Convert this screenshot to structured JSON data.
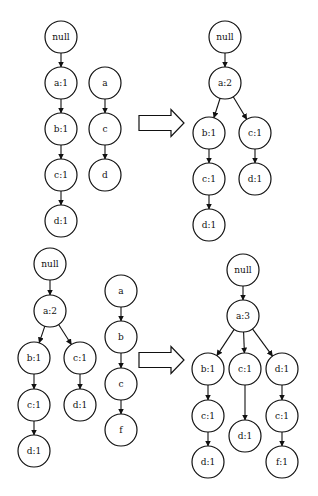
{
  "diagram": {
    "style": {
      "stroke": "#111111",
      "fill": "#ffffff",
      "node_radius": 16
    },
    "panels": [
      {
        "id": "p1-existing",
        "nodes": [
          {
            "id": "n1",
            "label": "null",
            "x": 61,
            "y": 37
          },
          {
            "id": "n2",
            "label": "a:1",
            "x": 61,
            "y": 83
          },
          {
            "id": "n3",
            "label": "b:1",
            "x": 61,
            "y": 129
          },
          {
            "id": "n4",
            "label": "c:1",
            "x": 61,
            "y": 175
          },
          {
            "id": "n5",
            "label": "d:1",
            "x": 61,
            "y": 221
          }
        ],
        "edges": [
          [
            "n1",
            "n2"
          ],
          [
            "n2",
            "n3"
          ],
          [
            "n3",
            "n4"
          ],
          [
            "n4",
            "n5"
          ]
        ]
      },
      {
        "id": "p1-transaction",
        "nodes": [
          {
            "id": "t1",
            "label": "a",
            "x": 105,
            "y": 83
          },
          {
            "id": "t2",
            "label": "c",
            "x": 105,
            "y": 129
          },
          {
            "id": "t3",
            "label": "d",
            "x": 105,
            "y": 175
          }
        ],
        "edges": [
          [
            "t1",
            "t2"
          ],
          [
            "t2",
            "t3"
          ]
        ]
      },
      {
        "id": "p1-result",
        "nodes": [
          {
            "id": "r1",
            "label": "null",
            "x": 225,
            "y": 37
          },
          {
            "id": "r2",
            "label": "a:2",
            "x": 225,
            "y": 83
          },
          {
            "id": "r3",
            "label": "b:1",
            "x": 209,
            "y": 133
          },
          {
            "id": "r4",
            "label": "c:1",
            "x": 255,
            "y": 133
          },
          {
            "id": "r5",
            "label": "c:1",
            "x": 209,
            "y": 179
          },
          {
            "id": "r6",
            "label": "d:1",
            "x": 255,
            "y": 179
          },
          {
            "id": "r7",
            "label": "d:1",
            "x": 209,
            "y": 225
          }
        ],
        "edges": [
          [
            "r1",
            "r2"
          ],
          [
            "r2",
            "r3"
          ],
          [
            "r2",
            "r4"
          ],
          [
            "r3",
            "r5"
          ],
          [
            "r4",
            "r6"
          ],
          [
            "r5",
            "r7"
          ]
        ]
      },
      {
        "id": "p2-existing",
        "nodes": [
          {
            "id": "m1",
            "label": "null",
            "x": 50,
            "y": 264
          },
          {
            "id": "m2",
            "label": "a:2",
            "x": 50,
            "y": 311
          },
          {
            "id": "m3",
            "label": "b:1",
            "x": 34,
            "y": 358
          },
          {
            "id": "m4",
            "label": "c:1",
            "x": 80,
            "y": 358
          },
          {
            "id": "m5",
            "label": "c:1",
            "x": 34,
            "y": 405
          },
          {
            "id": "m6",
            "label": "d:1",
            "x": 80,
            "y": 405
          },
          {
            "id": "m7",
            "label": "d:1",
            "x": 34,
            "y": 451
          }
        ],
        "edges": [
          [
            "m1",
            "m2"
          ],
          [
            "m2",
            "m3"
          ],
          [
            "m2",
            "m4"
          ],
          [
            "m3",
            "m5"
          ],
          [
            "m4",
            "m6"
          ],
          [
            "m5",
            "m7"
          ]
        ]
      },
      {
        "id": "p2-transaction",
        "nodes": [
          {
            "id": "u1",
            "label": "a",
            "x": 121,
            "y": 291
          },
          {
            "id": "u2",
            "label": "b",
            "x": 121,
            "y": 337
          },
          {
            "id": "u3",
            "label": "c",
            "x": 121,
            "y": 384
          },
          {
            "id": "u4",
            "label": "f",
            "x": 121,
            "y": 430
          }
        ],
        "edges": [
          [
            "u1",
            "u2"
          ],
          [
            "u2",
            "u3"
          ],
          [
            "u3",
            "u4"
          ]
        ]
      },
      {
        "id": "p2-result",
        "nodes": [
          {
            "id": "s1",
            "label": "null",
            "x": 243,
            "y": 270
          },
          {
            "id": "s2",
            "label": "a:3",
            "x": 243,
            "y": 316
          },
          {
            "id": "s3",
            "label": "b:1",
            "x": 208,
            "y": 369
          },
          {
            "id": "s4",
            "label": "c:1",
            "x": 245,
            "y": 369
          },
          {
            "id": "s5",
            "label": "d:1",
            "x": 282,
            "y": 369
          },
          {
            "id": "s6",
            "label": "c:1",
            "x": 208,
            "y": 416
          },
          {
            "id": "s7",
            "label": "d:1",
            "x": 245,
            "y": 436
          },
          {
            "id": "s8",
            "label": "c:1",
            "x": 282,
            "y": 416
          },
          {
            "id": "s9",
            "label": "d:1",
            "x": 208,
            "y": 462
          },
          {
            "id": "s10",
            "label": "f:1",
            "x": 282,
            "y": 462
          }
        ],
        "edges": [
          [
            "s1",
            "s2"
          ],
          [
            "s2",
            "s3"
          ],
          [
            "s2",
            "s4"
          ],
          [
            "s2",
            "s5"
          ],
          [
            "s3",
            "s6"
          ],
          [
            "s4",
            "s7"
          ],
          [
            "s5",
            "s8"
          ],
          [
            "s6",
            "s9"
          ],
          [
            "s8",
            "s10"
          ]
        ]
      }
    ],
    "block_arrows": [
      {
        "id": "arrow-1",
        "x1": 139,
        "x2": 184,
        "y": 123
      },
      {
        "id": "arrow-2",
        "x1": 139,
        "x2": 184,
        "y": 360
      }
    ]
  }
}
